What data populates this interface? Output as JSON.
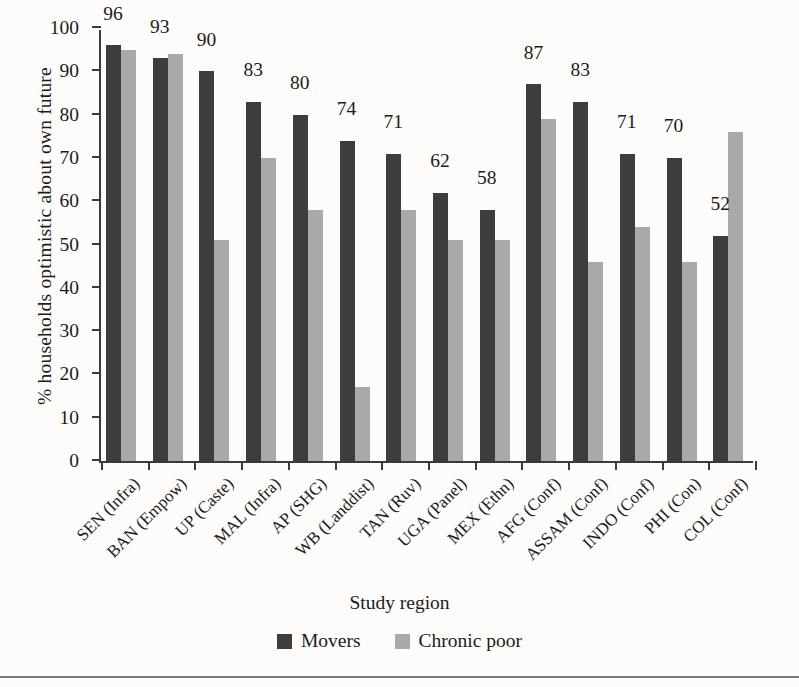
{
  "chart_data": {
    "type": "bar",
    "title": "",
    "xlabel": "Study region",
    "ylabel": "% households optimistic about own future",
    "ylim": [
      0,
      100
    ],
    "yticks": [
      0,
      10,
      20,
      30,
      40,
      50,
      60,
      70,
      80,
      90,
      100
    ],
    "grid": false,
    "legend_position": "bottom-center",
    "categories": [
      "SEN (Infra)",
      "BAN (Empow)",
      "UP (Caste)",
      "MAL (Infra)",
      "AP (SHG)",
      "WB (Landdist)",
      "TAN (Ruv)",
      "UGA (Panel)",
      "MEX (Ethn)",
      "AFG (Conf)",
      "ASSAM (Conf)",
      "INDO (Conf)",
      "PHI (Con)",
      "COL (Conf)"
    ],
    "series": [
      {
        "name": "Movers",
        "color": "#3d3d3d",
        "values": [
          96,
          93,
          90,
          83,
          80,
          74,
          71,
          62,
          58,
          87,
          83,
          71,
          70,
          52
        ],
        "data_labels": [
          "96",
          "93",
          "90",
          "83",
          "80",
          "74",
          "71",
          "62",
          "58",
          "87",
          "83",
          "71",
          "70",
          "52"
        ]
      },
      {
        "name": "Chronic poor",
        "color": "#a9a9a9",
        "values": [
          95,
          94,
          51,
          70,
          58,
          17,
          58,
          51,
          51,
          79,
          46,
          54,
          46,
          76
        ],
        "data_labels": []
      }
    ]
  },
  "legend": {
    "items": [
      {
        "label": "Movers",
        "key": "movers"
      },
      {
        "label": "Chronic poor",
        "key": "chronic"
      }
    ]
  }
}
